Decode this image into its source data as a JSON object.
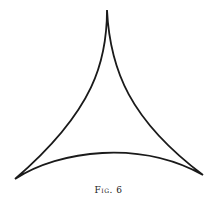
{
  "figure": {
    "caption": "Fig. 6",
    "shape": "deltoid (three-cusped hypocycloid)",
    "cusps": [
      {
        "name": "top",
        "x": 107,
        "y": 10
      },
      {
        "name": "bottom-left",
        "x": 15,
        "y": 179
      },
      {
        "name": "bottom-right",
        "x": 203,
        "y": 175
      }
    ],
    "stroke_color": "#1a1a1a"
  }
}
